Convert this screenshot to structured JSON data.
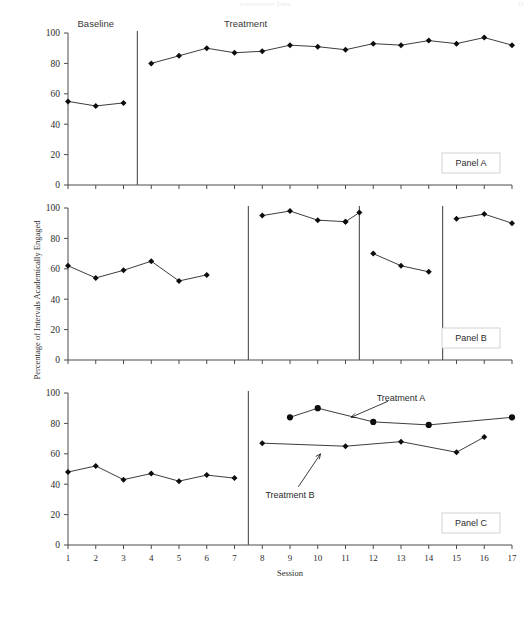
{
  "header": {
    "running_head": "Intervention Data",
    "page_number": "11"
  },
  "axes": {
    "y_title": "Percentage of Intervals Academically Engaged",
    "x_title": "Session",
    "y_ticks": [
      0,
      20,
      40,
      60,
      80,
      100
    ],
    "x_ticks": [
      1,
      2,
      3,
      4,
      5,
      6,
      7,
      8,
      9,
      10,
      11,
      12,
      13,
      14,
      15,
      16,
      17
    ],
    "y_min": 0,
    "y_max": 100,
    "x_min": 1,
    "x_max": 17
  },
  "panels": [
    {
      "id": "panel-a",
      "label": "Panel A",
      "phase_labels": [
        {
          "text": "Baseline",
          "x": 2.0
        },
        {
          "text": "Treatment",
          "x": 7.4
        }
      ],
      "phase_lines": [
        3.5
      ],
      "series": [
        {
          "name": "Panel A engagement",
          "marker": "diamond",
          "x": [
            1,
            2,
            3
          ],
          "values": [
            55,
            52,
            54
          ]
        },
        {
          "name": "Panel A treatment",
          "marker": "diamond",
          "x": [
            4,
            5,
            6,
            7,
            8,
            9,
            10,
            11,
            12,
            13,
            14,
            15,
            16,
            17
          ],
          "values": [
            80,
            85,
            90,
            87,
            88,
            92,
            91,
            89,
            93,
            92,
            95,
            93,
            97,
            92
          ]
        }
      ]
    },
    {
      "id": "panel-b",
      "label": "Panel B",
      "phase_labels": [],
      "phase_lines": [
        7.5,
        11.5,
        14.5
      ],
      "series": [
        {
          "name": "Panel B baseline",
          "marker": "diamond",
          "x": [
            1,
            2,
            3,
            4,
            5,
            6
          ],
          "values": [
            62,
            54,
            59,
            65,
            52,
            56
          ]
        },
        {
          "name": "Panel B treatment 1",
          "marker": "diamond",
          "x": [
            8,
            9,
            10,
            11
          ],
          "values": [
            95,
            98,
            92,
            91
          ]
        },
        {
          "name": "Panel B treatment 1 end",
          "marker": "diamond",
          "x": [
            11,
            11.5
          ],
          "values": [
            91,
            97
          ]
        },
        {
          "name": "Panel B return to baseline",
          "marker": "diamond",
          "x": [
            12,
            13,
            14
          ],
          "values": [
            70,
            62,
            58
          ]
        },
        {
          "name": "Panel B treatment 2",
          "marker": "diamond",
          "x": [
            15,
            16,
            17
          ],
          "values": [
            93,
            96,
            90
          ]
        }
      ]
    },
    {
      "id": "panel-c",
      "label": "Panel C",
      "phase_labels": [],
      "phase_lines": [
        7.5
      ],
      "annotations": [
        {
          "text": "Treatment A",
          "x": 13.0,
          "y": 97,
          "arrow_to_x": 11.2,
          "arrow_to_y": 84
        },
        {
          "text": "Treatment B",
          "x": 9.0,
          "y": 33,
          "arrow_to_x": 10.1,
          "arrow_to_y": 60
        }
      ],
      "series": [
        {
          "name": "Panel C baseline",
          "marker": "diamond",
          "x": [
            1,
            2,
            3,
            4,
            5,
            6,
            7
          ],
          "values": [
            48,
            52,
            43,
            47,
            42,
            46,
            44
          ]
        },
        {
          "name": "Treatment A",
          "marker": "circle",
          "x": [
            9,
            10,
            12,
            14,
            17
          ],
          "values": [
            84,
            90,
            81,
            79,
            84
          ]
        },
        {
          "name": "Treatment B",
          "marker": "diamond",
          "x": [
            8,
            11,
            13,
            15,
            16
          ],
          "values": [
            67,
            65,
            68,
            61,
            71
          ]
        }
      ]
    }
  ]
}
